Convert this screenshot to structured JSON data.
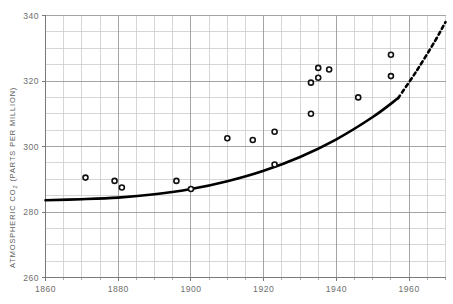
{
  "chart_data": {
    "type": "scatter",
    "title": "",
    "subtitle": "",
    "xlabel": "",
    "ylabel": "ATMOSPHERIC CO2 (PARTS PER MILLION)",
    "ylabel_parts": {
      "pre": "ATMOSPHERIC CO",
      "sub": "2",
      "post": " (PARTS PER MILLION)"
    },
    "xlim": [
      1860,
      1970
    ],
    "ylim": [
      260,
      340
    ],
    "x_major_ticks": [
      1860,
      1880,
      1900,
      1920,
      1940,
      1960
    ],
    "x_major_labels": [
      "1860",
      "1880",
      "1900",
      "1920",
      "1940",
      "1960"
    ],
    "x_minor_step": 5,
    "y_major_ticks": [
      260,
      280,
      300,
      320,
      340
    ],
    "y_major_labels": [
      "260",
      "280",
      "300",
      "320",
      "340"
    ],
    "y_minor_step": 5,
    "grid": true,
    "legend": "none",
    "series": [
      {
        "name": "observations",
        "type": "scatter",
        "marker": "open-circle",
        "points": [
          {
            "x": 1871,
            "y": 290.5
          },
          {
            "x": 1879,
            "y": 289.5
          },
          {
            "x": 1881,
            "y": 287.5
          },
          {
            "x": 1896,
            "y": 289.5
          },
          {
            "x": 1900,
            "y": 287.0
          },
          {
            "x": 1910,
            "y": 302.5
          },
          {
            "x": 1917,
            "y": 302.0
          },
          {
            "x": 1923,
            "y": 304.5
          },
          {
            "x": 1923,
            "y": 294.5
          },
          {
            "x": 1933,
            "y": 319.5
          },
          {
            "x": 1933,
            "y": 310.0
          },
          {
            "x": 1935,
            "y": 324.0
          },
          {
            "x": 1935,
            "y": 321.0
          },
          {
            "x": 1938,
            "y": 323.5
          },
          {
            "x": 1946,
            "y": 315.0
          },
          {
            "x": 1955,
            "y": 328.0
          },
          {
            "x": 1955,
            "y": 321.5
          }
        ]
      },
      {
        "name": "fitted-trend-solid",
        "type": "line",
        "style": "solid",
        "points": [
          {
            "x": 1860,
            "y": 283.6
          },
          {
            "x": 1870,
            "y": 283.9
          },
          {
            "x": 1880,
            "y": 284.4
          },
          {
            "x": 1890,
            "y": 285.4
          },
          {
            "x": 1900,
            "y": 287.0
          },
          {
            "x": 1910,
            "y": 289.4
          },
          {
            "x": 1920,
            "y": 292.6
          },
          {
            "x": 1930,
            "y": 296.8
          },
          {
            "x": 1940,
            "y": 302.2
          },
          {
            "x": 1950,
            "y": 309.0
          },
          {
            "x": 1957,
            "y": 314.8
          }
        ]
      },
      {
        "name": "projection-dashed",
        "type": "line",
        "style": "dashed",
        "points": [
          {
            "x": 1957,
            "y": 314.8
          },
          {
            "x": 1962,
            "y": 323.0
          },
          {
            "x": 1967,
            "y": 332.0
          },
          {
            "x": 1970,
            "y": 338.0
          }
        ]
      }
    ],
    "colors": {
      "background": "#ffffff",
      "grid_major": "#9a9a9a",
      "grid_minor": "#cccccc",
      "axis": "#7a7a7a",
      "curve": "#000000",
      "marker_stroke": "#111111",
      "tick_text": "#6e6e6e"
    }
  }
}
